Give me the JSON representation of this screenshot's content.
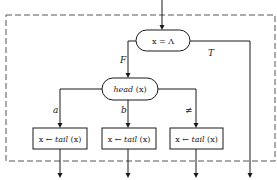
{
  "diagram": {
    "type": "flowchart",
    "colors": {
      "stroke": "#1a1a1a",
      "dash": "#555555",
      "background": "#ffffff"
    },
    "decision_top": {
      "label": "x = Λ",
      "true_label": "T",
      "false_label": "F"
    },
    "decision_head": {
      "label_func": "head",
      "label_arg": "(x)"
    },
    "branches": [
      {
        "label": "a",
        "assign_var": "x",
        "arrow": "←",
        "func": "tail",
        "arg": "(x)"
      },
      {
        "label": "b",
        "assign_var": "x",
        "arrow": "←",
        "func": "tail",
        "arg": "(x)"
      },
      {
        "label": "≠",
        "assign_var": "x",
        "arrow": "←",
        "func": "tail",
        "arg": "(x)"
      }
    ]
  }
}
